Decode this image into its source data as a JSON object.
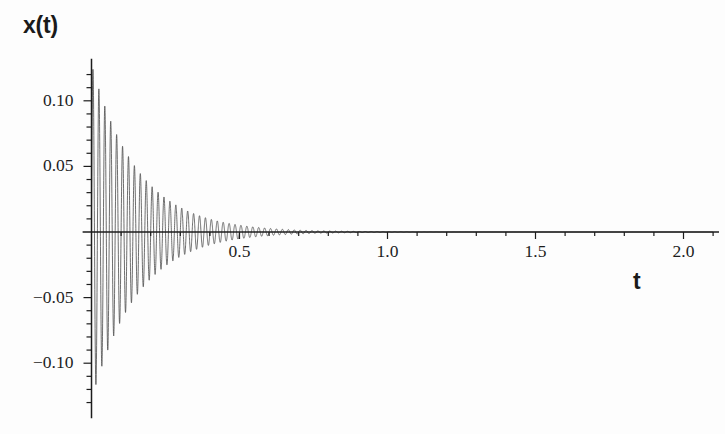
{
  "chart_data": {
    "type": "line",
    "title": "",
    "subtitle": "",
    "xlabel": "t",
    "ylabel": "x(t)",
    "xlim": [
      -0.03,
      2.12
    ],
    "ylim": [
      -0.142,
      0.132
    ],
    "grid": false,
    "legend": null,
    "annotations": [],
    "x_ticks_major": [
      0.5,
      1.0,
      1.5,
      2.0
    ],
    "x_ticklabels": [
      "0.5",
      "1.0",
      "1.5",
      "2.0"
    ],
    "x_ticks_minor": [
      0.1,
      0.2,
      0.3,
      0.4,
      0.6,
      0.7,
      0.8,
      0.9,
      1.1,
      1.2,
      1.3,
      1.4,
      1.6,
      1.7,
      1.8,
      1.9,
      2.1
    ],
    "y_ticks_major": [
      -0.1,
      -0.05,
      0.05,
      0.1
    ],
    "y_ticklabels": [
      "-0.10",
      "-0.05",
      "0.05",
      "0.10"
    ],
    "y_ticks_minor": [
      -0.13,
      -0.12,
      -0.11,
      -0.09,
      -0.08,
      -0.07,
      -0.06,
      -0.04,
      -0.03,
      -0.02,
      -0.01,
      0.01,
      0.02,
      0.03,
      0.04,
      0.06,
      0.07,
      0.08,
      0.09,
      0.11,
      0.12
    ],
    "series": [
      {
        "name": "x(t)",
        "color": "#4a4a4a",
        "line_width": 0.8,
        "model": "damped_sine",
        "amplitude": 0.128,
        "decay_rate": 6.4,
        "angular_frequency": 314.2,
        "frequency_hz": 50.0,
        "phase": 0.0,
        "t_start": 0.0,
        "t_end": 2.1,
        "samples": 9000,
        "peak_values": [
          {
            "t": 0.005,
            "x": 0.124
          },
          {
            "t": 0.025,
            "x": 0.109
          },
          {
            "t": 0.045,
            "x": 0.096
          },
          {
            "t": 0.065,
            "x": 0.084
          },
          {
            "t": 0.085,
            "x": 0.074
          },
          {
            "t": 0.105,
            "x": 0.065
          },
          {
            "t": 0.125,
            "x": 0.058
          },
          {
            "t": 0.145,
            "x": 0.051
          },
          {
            "t": 0.165,
            "x": 0.045
          },
          {
            "t": 0.185,
            "x": 0.039
          },
          {
            "t": 0.205,
            "x": 0.035
          },
          {
            "t": 0.225,
            "x": 0.031
          },
          {
            "t": 0.245,
            "x": 0.027
          },
          {
            "t": 0.285,
            "x": 0.021
          },
          {
            "t": 0.325,
            "x": 0.016
          },
          {
            "t": 0.365,
            "x": 0.013
          },
          {
            "t": 0.405,
            "x": 0.01
          },
          {
            "t": 0.505,
            "x": 0.005
          },
          {
            "t": 0.605,
            "x": 0.0027
          },
          {
            "t": 0.805,
            "x": 0.0008
          },
          {
            "t": 1.005,
            "x": 0.0002
          }
        ],
        "trough_values": [
          {
            "t": 0.015,
            "x": -0.132
          },
          {
            "t": 0.035,
            "x": -0.102
          },
          {
            "t": 0.055,
            "x": -0.09
          },
          {
            "t": 0.075,
            "x": -0.079
          },
          {
            "t": 0.095,
            "x": -0.07
          },
          {
            "t": 0.115,
            "x": -0.061
          },
          {
            "t": 0.135,
            "x": -0.054
          },
          {
            "t": 0.155,
            "x": -0.048
          },
          {
            "t": 0.175,
            "x": -0.042
          },
          {
            "t": 0.195,
            "x": -0.037
          },
          {
            "t": 0.215,
            "x": -0.033
          },
          {
            "t": 0.235,
            "x": -0.029
          },
          {
            "t": 0.255,
            "x": -0.025
          },
          {
            "t": 0.295,
            "x": -0.019
          },
          {
            "t": 0.335,
            "x": -0.015
          },
          {
            "t": 0.375,
            "x": -0.012
          },
          {
            "t": 0.415,
            "x": -0.009
          },
          {
            "t": 0.515,
            "x": -0.0045
          },
          {
            "t": 0.615,
            "x": -0.0024
          },
          {
            "t": 0.815,
            "x": -0.0007
          },
          {
            "t": 1.015,
            "x": -0.0002
          }
        ]
      }
    ]
  },
  "axes": {
    "x_axis_color": "#1c1c1c",
    "y_axis_color": "#1c1c1c",
    "curve_color": "#4a4a4a",
    "background": "#fdfdfd"
  }
}
